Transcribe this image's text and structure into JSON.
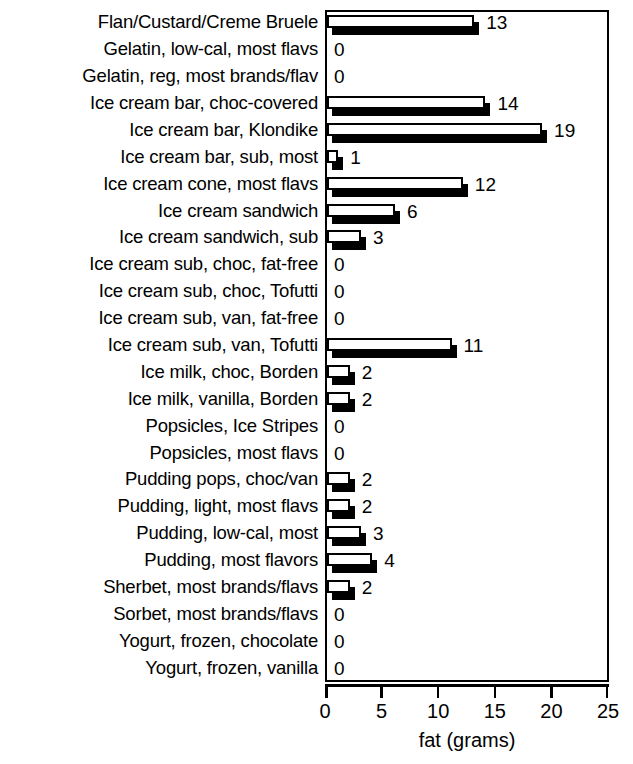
{
  "chart_data": {
    "type": "bar",
    "orientation": "horizontal",
    "title": "",
    "xlabel": "fat (grams)",
    "ylabel": "",
    "xlim": [
      0,
      25
    ],
    "xticks": [
      0,
      5,
      10,
      15,
      20,
      25
    ],
    "grid": false,
    "legend": null,
    "bar_style": "white-fill-black-outline-with-black-drop-shadow",
    "value_labels_shown": true,
    "categories": [
      "Flan/Custard/Creme Bruele",
      "Gelatin, low-cal, most flavs",
      "Gelatin, reg, most brands/flav",
      "Ice cream bar, choc-covered",
      "Ice cream bar, Klondike",
      "Ice cream bar, sub, most",
      "Ice cream cone, most flavs",
      "Ice cream sandwich",
      "Ice cream sandwich, sub",
      "Ice cream sub, choc, fat-free",
      "Ice cream sub, choc, Tofutti",
      "Ice cream sub, van, fat-free",
      "Ice cream sub, van, Tofutti",
      "Ice milk, choc, Borden",
      "Ice milk, vanilla, Borden",
      "Popsicles, Ice Stripes",
      "Popsicles, most flavs",
      "Pudding pops, choc/van",
      "Pudding, light, most flavs",
      "Pudding, low-cal, most",
      "Pudding, most flavors",
      "Sherbet, most brands/flavs",
      "Sorbet, most brands/flavs",
      "Yogurt, frozen, chocolate",
      "Yogurt, frozen, vanilla"
    ],
    "values": [
      13,
      0,
      0,
      14,
      19,
      1,
      12,
      6,
      3,
      0,
      0,
      0,
      11,
      2,
      2,
      0,
      0,
      2,
      2,
      3,
      4,
      2,
      0,
      0,
      0
    ],
    "value_label_texts": [
      "13",
      "0",
      "0",
      "14",
      "19",
      "1",
      "12",
      "6",
      "3",
      "0",
      "0",
      "0",
      "11",
      "2",
      "2",
      "0",
      "0",
      "2",
      "2",
      "3",
      "4",
      "2",
      "0",
      "0",
      "0"
    ],
    "xticklabels": [
      "0",
      "5",
      "10",
      "15",
      "20",
      "25"
    ],
    "colors": {
      "bar_face": "#ffffff",
      "bar_edge": "#000000",
      "bar_shadow": "#000000",
      "axis": "#000000",
      "text": "#000000",
      "background": "#ffffff"
    }
  }
}
